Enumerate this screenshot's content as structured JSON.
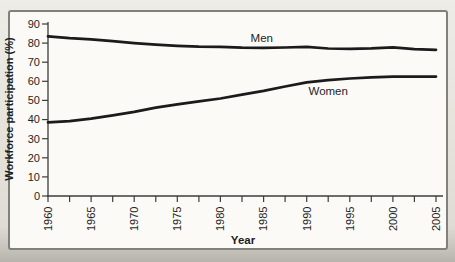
{
  "figure": {
    "outer_background": "#e4e2db",
    "card_background": "#fbfaf6",
    "card_border_color": "#81817c"
  },
  "chart_data": {
    "type": "line",
    "title": "",
    "xlabel": "Year",
    "ylabel": "Workforce participation (%)",
    "xlim": [
      1960,
      2005
    ],
    "ylim": [
      0,
      90
    ],
    "grid": false,
    "legend": "inline-labels",
    "axis_color": "#3c3c3c",
    "line_color": "#1b1b1b",
    "text_color": "#1e1e1e",
    "y_ticks": [
      90,
      80,
      70,
      60,
      50,
      40,
      30,
      20,
      10,
      0
    ],
    "x_major_ticks": [
      1960,
      1965,
      1970,
      1975,
      1980,
      1985,
      1990,
      1995,
      2000,
      2005
    ],
    "x_minor_tick_step": 2.5,
    "x": [
      1960,
      1962.5,
      1965,
      1967.5,
      1970,
      1972.5,
      1975,
      1977.5,
      1980,
      1982.5,
      1985,
      1987.5,
      1990,
      1992.5,
      1995,
      1997.5,
      2000,
      2002.5,
      2005
    ],
    "series": [
      {
        "name": "Men",
        "values": [
          83.5,
          82.6,
          82.0,
          81.0,
          80.0,
          79.2,
          78.6,
          78.2,
          78.0,
          77.6,
          77.5,
          77.7,
          78.0,
          77.2,
          77.0,
          77.3,
          77.8,
          76.8,
          76.5
        ],
        "label": {
          "x": 1984.8,
          "y": 82.7
        }
      },
      {
        "name": "Women",
        "values": [
          38.5,
          39.2,
          40.5,
          42.2,
          44.0,
          46.2,
          48.0,
          49.5,
          51.0,
          53.0,
          55.0,
          57.3,
          59.5,
          60.6,
          61.5,
          62.1,
          62.5,
          62.4,
          62.5
        ],
        "label": {
          "x": 1992.5,
          "y": 54.9
        }
      }
    ]
  }
}
